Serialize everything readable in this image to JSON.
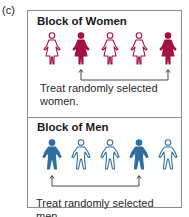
{
  "panel_label": "(c)",
  "colors": {
    "women": "#a3123f",
    "men": "#2f6f9f",
    "border": "#8a8a8a",
    "arrow": "#333333"
  },
  "blocks": [
    {
      "id": "women",
      "title": "Block of Women",
      "figures": [
        {
          "type": "woman",
          "treated": false
        },
        {
          "type": "woman",
          "treated": true
        },
        {
          "type": "woman",
          "treated": false
        },
        {
          "type": "woman",
          "treated": false
        },
        {
          "type": "woman",
          "treated": true
        }
      ],
      "caption": "Treat randomly selected women."
    },
    {
      "id": "men",
      "title": "Block of Men",
      "figures": [
        {
          "type": "man",
          "treated": true
        },
        {
          "type": "man",
          "treated": false
        },
        {
          "type": "man",
          "treated": false
        },
        {
          "type": "man",
          "treated": true
        },
        {
          "type": "man",
          "treated": false
        }
      ],
      "caption": "Treat randomly selected men."
    }
  ]
}
